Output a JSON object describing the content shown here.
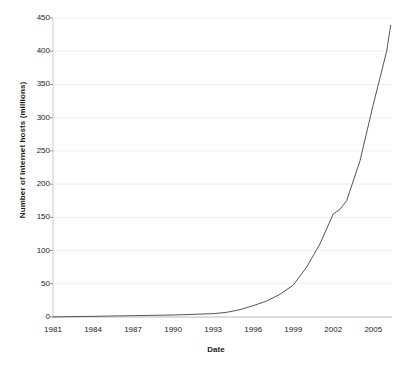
{
  "chart_data": {
    "type": "line",
    "title": "",
    "xlabel": "Date",
    "ylabel": "Number of Internet hosts (millions)",
    "xlim": [
      1981,
      2006.4
    ],
    "ylim": [
      0,
      450
    ],
    "xticks": [
      "1981",
      "1984",
      "1987",
      "1990",
      "1993",
      "1996",
      "1999",
      "2002",
      "2005"
    ],
    "xtick_values": [
      1981,
      1984,
      1987,
      1990,
      1993,
      1996,
      1999,
      2002,
      2005
    ],
    "yticks": [
      "0",
      "50",
      "100",
      "150",
      "200",
      "250",
      "300",
      "350",
      "400",
      "450"
    ],
    "ytick_values": [
      0,
      50,
      100,
      150,
      200,
      250,
      300,
      350,
      400,
      450
    ],
    "grid": "horizontal",
    "legend": "none",
    "line_color": "#555555",
    "grid_color": "#eeeeee",
    "axis_color": "#cccccc",
    "background": "#ffffff",
    "series": [
      {
        "name": "Internet hosts",
        "x": [
          1981,
          1982,
          1983,
          1984,
          1985,
          1986,
          1987,
          1988,
          1989,
          1990,
          1991,
          1992,
          1993,
          1994,
          1995,
          1996,
          1996.5,
          1997,
          1997.5,
          1998,
          1998.5,
          1999,
          1999.5,
          2000,
          2000.5,
          2001,
          2001.5,
          2002,
          2002.3,
          2002.6,
          2003,
          2003.5,
          2004,
          2004.5,
          2005,
          2005.5,
          2006,
          2006.3
        ],
        "values": [
          0.2,
          0.24,
          0.6,
          1,
          2,
          5,
          10,
          33,
          80,
          0.3,
          0.6,
          1,
          1.8,
          3.2,
          6.6,
          12.9,
          16.1,
          19.5,
          26,
          29.7,
          36.7,
          43.2,
          56.2,
          72.4,
          93,
          109.6,
          125.9,
          147.3,
          156,
          162,
          171.6,
          185,
          233,
          285,
          318,
          353,
          395,
          439
        ]
      }
    ],
    "series_corrected": {
      "note": "values read off the plotted curve in millions of hosts",
      "points": [
        [
          1981,
          0.2
        ],
        [
          1984,
          1.0
        ],
        [
          1987,
          2.0
        ],
        [
          1990,
          3.0
        ],
        [
          1993,
          5.0
        ],
        [
          1994,
          7.0
        ],
        [
          1995,
          11.0
        ],
        [
          1996,
          17.0
        ],
        [
          1997,
          24.0
        ],
        [
          1998,
          34.0
        ],
        [
          1999,
          48.0
        ],
        [
          2000,
          75.0
        ],
        [
          2001,
          110.0
        ],
        [
          2002,
          155.0
        ],
        [
          2002.5,
          162.0
        ],
        [
          2003,
          175.0
        ],
        [
          2004,
          235.0
        ],
        [
          2005,
          320.0
        ],
        [
          2006,
          400.0
        ],
        [
          2006.3,
          439.0
        ]
      ]
    }
  },
  "figure": {
    "ylabel_text": "Number of Internet hosts (millions)",
    "xlabel_text": "Date"
  }
}
